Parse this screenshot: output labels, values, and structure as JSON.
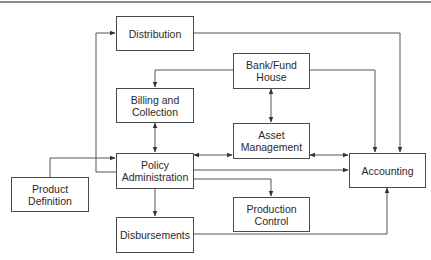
{
  "diagram": {
    "nodes": [
      {
        "id": "distribution",
        "label": "Distribution"
      },
      {
        "id": "bank_fund_house",
        "label": "Bank/Fund\nHouse"
      },
      {
        "id": "billing_collection",
        "label": "Billing and\nCollection"
      },
      {
        "id": "asset_management",
        "label": "Asset\nManagement"
      },
      {
        "id": "policy_administration",
        "label": "Policy\nAdministration"
      },
      {
        "id": "accounting",
        "label": "Accounting"
      },
      {
        "id": "product_definition",
        "label": "Product\nDefinition"
      },
      {
        "id": "production_control",
        "label": "Production\nControl"
      },
      {
        "id": "disbursements",
        "label": "Disbursements"
      }
    ],
    "edges": [
      {
        "from": "policy_administration",
        "to": "distribution",
        "direction": "one-way"
      },
      {
        "from": "distribution",
        "to": "accounting",
        "direction": "one-way"
      },
      {
        "from": "bank_fund_house",
        "to": "billing_collection",
        "direction": "one-way"
      },
      {
        "from": "bank_fund_house",
        "to": "accounting",
        "direction": "one-way"
      },
      {
        "from": "bank_fund_house",
        "to": "asset_management",
        "direction": "two-way"
      },
      {
        "from": "billing_collection",
        "to": "policy_administration",
        "direction": "two-way"
      },
      {
        "from": "policy_administration",
        "to": "asset_management",
        "direction": "two-way"
      },
      {
        "from": "asset_management",
        "to": "accounting",
        "direction": "two-way"
      },
      {
        "from": "policy_administration",
        "to": "accounting",
        "direction": "one-way"
      },
      {
        "from": "policy_administration",
        "to": "production_control",
        "direction": "one-way"
      },
      {
        "from": "policy_administration",
        "to": "disbursements",
        "direction": "one-way"
      },
      {
        "from": "product_definition",
        "to": "policy_administration",
        "direction": "one-way"
      },
      {
        "from": "disbursements",
        "to": "accounting",
        "direction": "one-way"
      }
    ]
  }
}
